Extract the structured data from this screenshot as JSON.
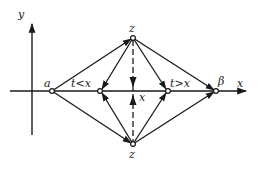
{
  "diagram": {
    "axes": {
      "y_label": "y",
      "x_label": "x"
    },
    "points": {
      "a": "a",
      "t_less": "t<x",
      "center": "x",
      "t_greater": "t>x",
      "beta": "β",
      "z_top": "z",
      "z_bottom": "z"
    },
    "colors": {
      "ink": "#1a1a1a",
      "background": "#ffffff"
    },
    "edges": [
      {
        "from": "a",
        "to": "z_top",
        "arrow": "end"
      },
      {
        "from": "a",
        "to": "z_bottom",
        "arrow": "end"
      },
      {
        "from": "z_top",
        "to": "t_less",
        "arrow": "end"
      },
      {
        "from": "z_bottom",
        "to": "t_less",
        "arrow": "end"
      },
      {
        "from": "z_top",
        "to": "t_greater",
        "arrow": "end"
      },
      {
        "from": "z_bottom",
        "to": "t_greater",
        "arrow": "end"
      },
      {
        "from": "z_top",
        "to": "beta",
        "arrow": "end"
      },
      {
        "from": "z_bottom",
        "to": "beta",
        "arrow": "end"
      },
      {
        "from": "z_top",
        "to": "center",
        "style": "dashed",
        "arrow": "end"
      },
      {
        "from": "z_bottom",
        "to": "center",
        "style": "dashed",
        "arrow": "end"
      }
    ]
  }
}
